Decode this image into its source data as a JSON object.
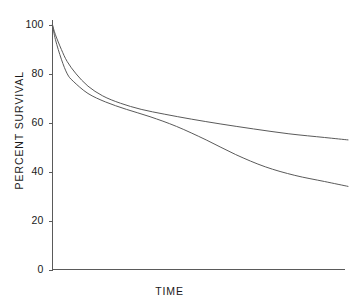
{
  "chart_data": {
    "type": "line",
    "title": "",
    "xlabel": "TIME",
    "ylabel": "PERCENT SURVIVAL",
    "grid": false,
    "legend": "none",
    "ylim": [
      0,
      100
    ],
    "yticks": [
      0,
      20,
      40,
      60,
      80,
      100
    ],
    "ytick_labels": [
      "0",
      "20",
      "40",
      "60",
      "80",
      "100"
    ],
    "xlim": [
      0,
      100
    ],
    "xticks": [],
    "xtick_labels": [],
    "axis_color": "#5a5a5a",
    "series": [
      {
        "name": "upper curve",
        "color": "#5a5a5a",
        "x": [
          0,
          1,
          3,
          5,
          8,
          12,
          17,
          23,
          30,
          38,
          47,
          57,
          68,
          80,
          92,
          100
        ],
        "values": [
          100,
          96,
          90,
          85,
          80,
          75,
          71,
          68,
          65.5,
          63.5,
          61.5,
          59.5,
          57.5,
          55.5,
          54,
          53
        ]
      },
      {
        "name": "lower curve",
        "color": "#5a5a5a",
        "x": [
          0,
          1,
          3,
          5,
          7,
          12,
          18,
          25,
          33,
          42,
          52,
          62,
          72,
          82,
          92,
          100
        ],
        "values": [
          100,
          94,
          86,
          80,
          77,
          72,
          68.5,
          65.5,
          62.5,
          58.5,
          53,
          47,
          42,
          38.5,
          36,
          34
        ]
      }
    ],
    "crossing_point": {
      "x": 48,
      "y": 61
    }
  },
  "axis": {
    "y_label_text": "PERCENT SURVIVAL",
    "x_label_text": "TIME",
    "ticks": [
      {
        "label": "100",
        "value": 100
      },
      {
        "label": "80",
        "value": 80
      },
      {
        "label": "60",
        "value": 60
      },
      {
        "label": "40",
        "value": 40
      },
      {
        "label": "20",
        "value": 20
      },
      {
        "label": "0",
        "value": 0
      }
    ]
  }
}
